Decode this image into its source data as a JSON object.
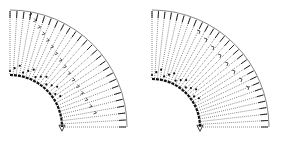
{
  "figure": {
    "colors": {
      "background": "#ffffff",
      "ink": "#111111",
      "dots": "#333333"
    },
    "panels": [
      {
        "id": "left",
        "center": [
          10,
          127
        ],
        "inner_radius": 52,
        "outer_radius": 117,
        "start_angle_deg": 90,
        "end_angle_deg": 0,
        "ray_count": 26,
        "diagonal_seam": true
      },
      {
        "id": "right",
        "center": [
          10,
          127
        ],
        "inner_radius": 48,
        "outer_radius": 117,
        "start_angle_deg": 90,
        "end_angle_deg": 0,
        "ray_count": 28,
        "diagonal_seam": false
      }
    ]
  }
}
